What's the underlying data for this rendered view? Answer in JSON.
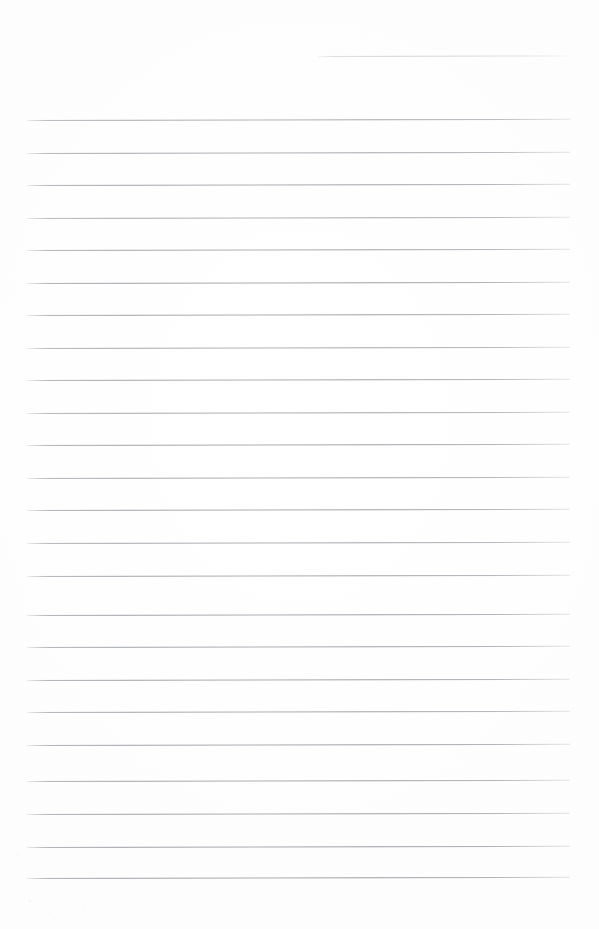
{
  "document": {
    "kind": "scanned-lined-notebook-page",
    "title": "Blank Lined Notebook Page",
    "page_width": 599,
    "page_height": 929,
    "background_color": "#fdfdfd",
    "has_text_content": false,
    "has_handwriting": false,
    "has_margin_rule": false,
    "notes_text": ""
  },
  "ruling": {
    "line_color": "#8e9298",
    "line_thickness_px": 1,
    "line_spacing_px": 32.55,
    "left_margin_px": 27,
    "right_edge_px": 570,
    "full_line_count": 24,
    "partial_line_count": 1,
    "skew_degrees": -0.12,
    "lines": [
      {
        "id": "rule-partial-0",
        "y": 56,
        "x_start": 318,
        "x_end": 570,
        "partial": true,
        "opacity": 0.52
      },
      {
        "id": "rule-1",
        "y": 120,
        "x_start": 27,
        "x_end": 570,
        "partial": false,
        "opacity": 0.8
      },
      {
        "id": "rule-2",
        "y": 152.5,
        "x_start": 27,
        "x_end": 570,
        "partial": false,
        "opacity": 0.82
      },
      {
        "id": "rule-3",
        "y": 185,
        "x_start": 27,
        "x_end": 570,
        "partial": false,
        "opacity": 0.86
      },
      {
        "id": "rule-4",
        "y": 217.6,
        "x_start": 27,
        "x_end": 570,
        "partial": false,
        "opacity": 0.8
      },
      {
        "id": "rule-5",
        "y": 250.1,
        "x_start": 27,
        "x_end": 570,
        "partial": false,
        "opacity": 0.84
      },
      {
        "id": "rule-6",
        "y": 282.7,
        "x_start": 27,
        "x_end": 570,
        "partial": false,
        "opacity": 0.88
      },
      {
        "id": "rule-7",
        "y": 315.2,
        "x_start": 27,
        "x_end": 570,
        "partial": false,
        "opacity": 0.86
      },
      {
        "id": "rule-8",
        "y": 347.7,
        "x_start": 27,
        "x_end": 570,
        "partial": false,
        "opacity": 0.82
      },
      {
        "id": "rule-9",
        "y": 380.3,
        "x_start": 27,
        "x_end": 570,
        "partial": false,
        "opacity": 0.85
      },
      {
        "id": "rule-10",
        "y": 412.8,
        "x_start": 27,
        "x_end": 570,
        "partial": false,
        "opacity": 0.83
      },
      {
        "id": "rule-11",
        "y": 445.4,
        "x_start": 27,
        "x_end": 570,
        "partial": false,
        "opacity": 0.87
      },
      {
        "id": "rule-12",
        "y": 477.9,
        "x_start": 27,
        "x_end": 570,
        "partial": false,
        "opacity": 0.84
      },
      {
        "id": "rule-13",
        "y": 510.4,
        "x_start": 27,
        "x_end": 570,
        "partial": false,
        "opacity": 0.86
      },
      {
        "id": "rule-14",
        "y": 543,
        "x_start": 27,
        "x_end": 570,
        "partial": false,
        "opacity": 0.83
      },
      {
        "id": "rule-15",
        "y": 575.5,
        "x_start": 27,
        "x_end": 570,
        "partial": false,
        "opacity": 0.85
      },
      {
        "id": "rule-16",
        "y": 614.7,
        "x_start": 27,
        "x_end": 570,
        "partial": false,
        "opacity": 0.88
      },
      {
        "id": "rule-17",
        "y": 647.2,
        "x_start": 27,
        "x_end": 570,
        "partial": false,
        "opacity": 0.86
      },
      {
        "id": "rule-18",
        "y": 679.8,
        "x_start": 27,
        "x_end": 570,
        "partial": false,
        "opacity": 0.87
      },
      {
        "id": "rule-19",
        "y": 712.3,
        "x_start": 27,
        "x_end": 570,
        "partial": false,
        "opacity": 0.85
      },
      {
        "id": "rule-20",
        "y": 744.9,
        "x_start": 27,
        "x_end": 570,
        "partial": false,
        "opacity": 0.88
      },
      {
        "id": "rule-21",
        "y": 781,
        "x_start": 27,
        "x_end": 570,
        "partial": false,
        "opacity": 0.86
      },
      {
        "id": "rule-22",
        "y": 813.5,
        "x_start": 27,
        "x_end": 570,
        "partial": false,
        "opacity": 0.87
      },
      {
        "id": "rule-23",
        "y": 847,
        "x_start": 27,
        "x_end": 570,
        "partial": false,
        "opacity": 0.9
      },
      {
        "id": "rule-24",
        "y": 878,
        "x_start": 27,
        "x_end": 570,
        "partial": false,
        "opacity": 0.9
      }
    ]
  }
}
